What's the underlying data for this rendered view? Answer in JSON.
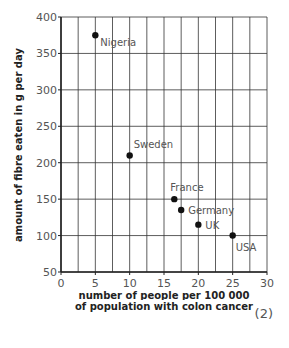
{
  "chart_data": {
    "type": "scatter",
    "title": "",
    "xlabel": "number of people per 100 000 of population with colon cancer",
    "xlabel_lines": [
      "number of people per 100 000",
      "of population with colon cancer"
    ],
    "ylabel": "amount of fibre eaten in g per day",
    "xlim": [
      0,
      30
    ],
    "ylim": [
      50,
      400
    ],
    "x_ticks": [
      0,
      5,
      10,
      15,
      20,
      25,
      30
    ],
    "y_ticks": [
      50,
      100,
      150,
      200,
      250,
      300,
      350,
      400
    ],
    "x_minor_step": 2.5,
    "y_major_step": 50,
    "grid": true,
    "legend": "none",
    "points": [
      {
        "label": "Nigeria",
        "x": 5,
        "y": 375
      },
      {
        "label": "Sweden",
        "x": 10,
        "y": 210
      },
      {
        "label": "France",
        "x": 16.5,
        "y": 150
      },
      {
        "label": "Germany",
        "x": 17.5,
        "y": 135
      },
      {
        "label": "UK",
        "x": 20,
        "y": 115
      },
      {
        "label": "USA",
        "x": 25,
        "y": 100
      }
    ]
  },
  "marks": "(2)",
  "colors": {
    "grid": "#333333",
    "axis": "#222222",
    "point": "#111111",
    "text": "#555555"
  }
}
